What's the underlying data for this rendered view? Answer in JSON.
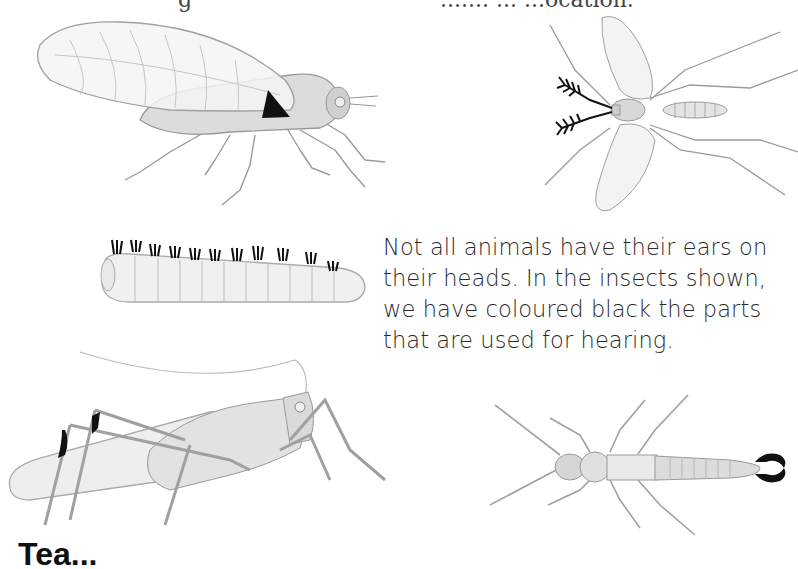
{
  "page": {
    "top_cut_text_left": "g",
    "top_cut_text_right": "....... ... ...ocation.",
    "caption_lines": [
      "Not all animals have their ears on",
      "their heads. In the insects shown,",
      "we have coloured black the parts",
      "that are used for hearing."
    ],
    "bottom_cut_heading": "Tea...",
    "illustrations": [
      {
        "name": "cicada",
        "hearing_part": "abdomen tympanum (black triangle)"
      },
      {
        "name": "mosquito",
        "hearing_part": "feathery antennae (black)"
      },
      {
        "name": "caterpillar",
        "hearing_part": "body hairs (black tufts)"
      },
      {
        "name": "cricket",
        "hearing_part": "front-leg ears (black)"
      },
      {
        "name": "earwig",
        "hearing_part": "tail pincers (black)"
      }
    ],
    "colors": {
      "ink": "#111111",
      "sketch": "#9a9a9a",
      "fill": "#e6e6e6",
      "text": "#2a2a2a"
    }
  }
}
